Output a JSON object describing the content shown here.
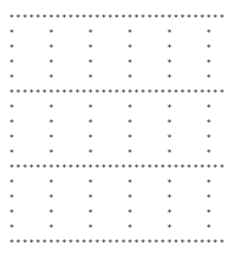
{
  "canvas": {
    "width": 240,
    "height": 275,
    "background_color": "#ffffff",
    "glyph_color": "#2b2b2b",
    "glyph": "*",
    "space": " "
  },
  "grid": {
    "columns": 33,
    "rows": 16,
    "char_pitch_px": 6.55,
    "line_height_px": 15.0,
    "origin_x_px": 11,
    "origin_y_px": 19,
    "full_row_indices": [
      0,
      5,
      10,
      15
    ],
    "sparse_column_indices": [
      0,
      6,
      12,
      18,
      24,
      30
    ],
    "sparse_column_x_px": [
      12,
      54,
      96,
      138,
      180,
      222
    ],
    "full_row_y_px": [
      19,
      99,
      180,
      261
    ],
    "asterisks_per_full_row": 33,
    "asterisks_per_sparse_row": 6
  },
  "art": {
    "lines": [
      "*********************************",
      "*     *     *     *     *     *",
      "*     *     *     *     *     *",
      "*     *     *     *     *     *",
      "*     *     *     *     *     *",
      "*********************************",
      "*     *     *     *     *     *",
      "*     *     *     *     *     *",
      "*     *     *     *     *     *",
      "*     *     *     *     *     *",
      "*********************************",
      "*     *     *     *     *     *",
      "*     *     *     *     *     *",
      "*     *     *     *     *     *",
      "*     *     *     *     *     *",
      "*********************************"
    ],
    "text": "*********************************\n*     *     *     *     *     *\n*     *     *     *     *     *\n*     *     *     *     *     *\n*     *     *     *     *     *\n*********************************\n*     *     *     *     *     *\n*     *     *     *     *     *\n*     *     *     *     *     *\n*     *     *     *     *     *\n*********************************\n*     *     *     *     *     *\n*     *     *     *     *     *\n*     *     *     *     *     *\n*     *     *     *     *     *\n*********************************"
  }
}
